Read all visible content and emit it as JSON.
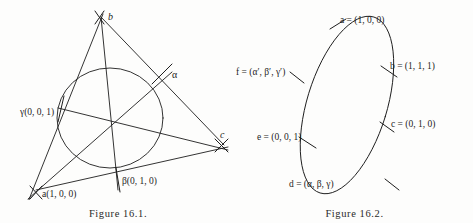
{
  "page": {
    "background_color": "#fdfdfc",
    "ink_color": "#1d1d1d"
  },
  "figures": [
    {
      "id": "figure-16-1",
      "caption": "Figure 16.1.",
      "description": "Triangle with inscribed circle and three concurrent cevians",
      "vertices": [
        {
          "name": "b",
          "label": "b",
          "x": 100,
          "y": 16
        },
        {
          "name": "c",
          "label": "c",
          "x": 219,
          "y": 137
        },
        {
          "name": "a",
          "label": "a(1, 0, 0)",
          "x": 42,
          "y": 193
        }
      ],
      "points": [
        {
          "name": "alpha",
          "label": "α",
          "x": 163,
          "y": 77
        },
        {
          "name": "beta",
          "label": "β(0, 1, 0)",
          "x": 122,
          "y": 181
        },
        {
          "name": "gamma",
          "label": "γ(0, 0, 1)",
          "x": 22,
          "y": 113
        }
      ]
    },
    {
      "id": "figure-16-2",
      "caption": "Figure 16.2.",
      "description": "Conic (ellipse) through six labelled points",
      "points": [
        {
          "name": "point-a",
          "label": "a = (1, 0, 0)"
        },
        {
          "name": "point-b",
          "label": "b = (1, 1, 1)"
        },
        {
          "name": "point-c",
          "label": "c = (0, 1, 0)"
        },
        {
          "name": "point-d",
          "label": "d = (α, β, γ)"
        },
        {
          "name": "point-e",
          "label": "e = (0, 0, 1)"
        },
        {
          "name": "point-f",
          "label": "f = (α′, β′, γ′)"
        }
      ]
    }
  ]
}
